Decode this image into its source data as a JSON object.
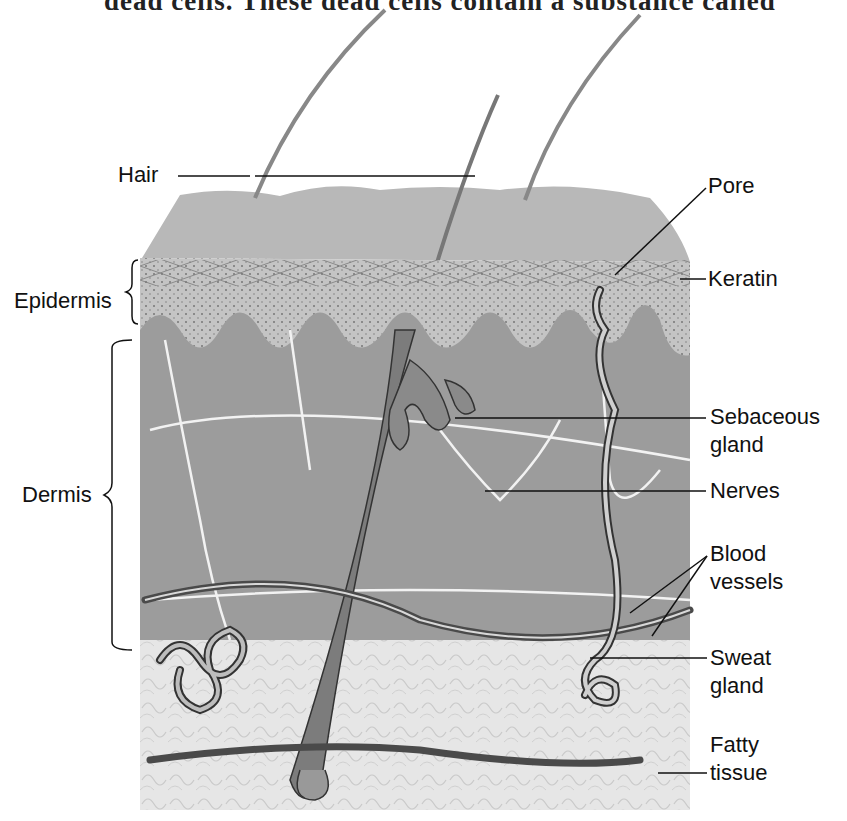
{
  "caption": {
    "text": "dead cells. These dead cells contain a substance called"
  },
  "diagram": {
    "colors": {
      "background": "#ffffff",
      "surface": "#b4b4b4",
      "dermis": "#9a9a9a",
      "epidermis": "#c2c2c2",
      "fatty_tissue": "#e4e4e4",
      "nerves": "#f2f2f2",
      "vessels": "#5a5a5a",
      "label_text": "#111111",
      "leader_lines": "#111111"
    },
    "labels": {
      "hair": "Hair",
      "pore": "Pore",
      "keratin": "Keratin",
      "epidermis": "Epidermis",
      "dermis": "Dermis",
      "sebaceous_line1": "Sebaceous",
      "sebaceous_line2": "gland",
      "nerves": "Nerves",
      "blood_line1": "Blood",
      "blood_line2": "vessels",
      "sweat_line1": "Sweat",
      "sweat_line2": "gland",
      "fatty_line1": "Fatty",
      "fatty_line2": "tissue"
    }
  }
}
